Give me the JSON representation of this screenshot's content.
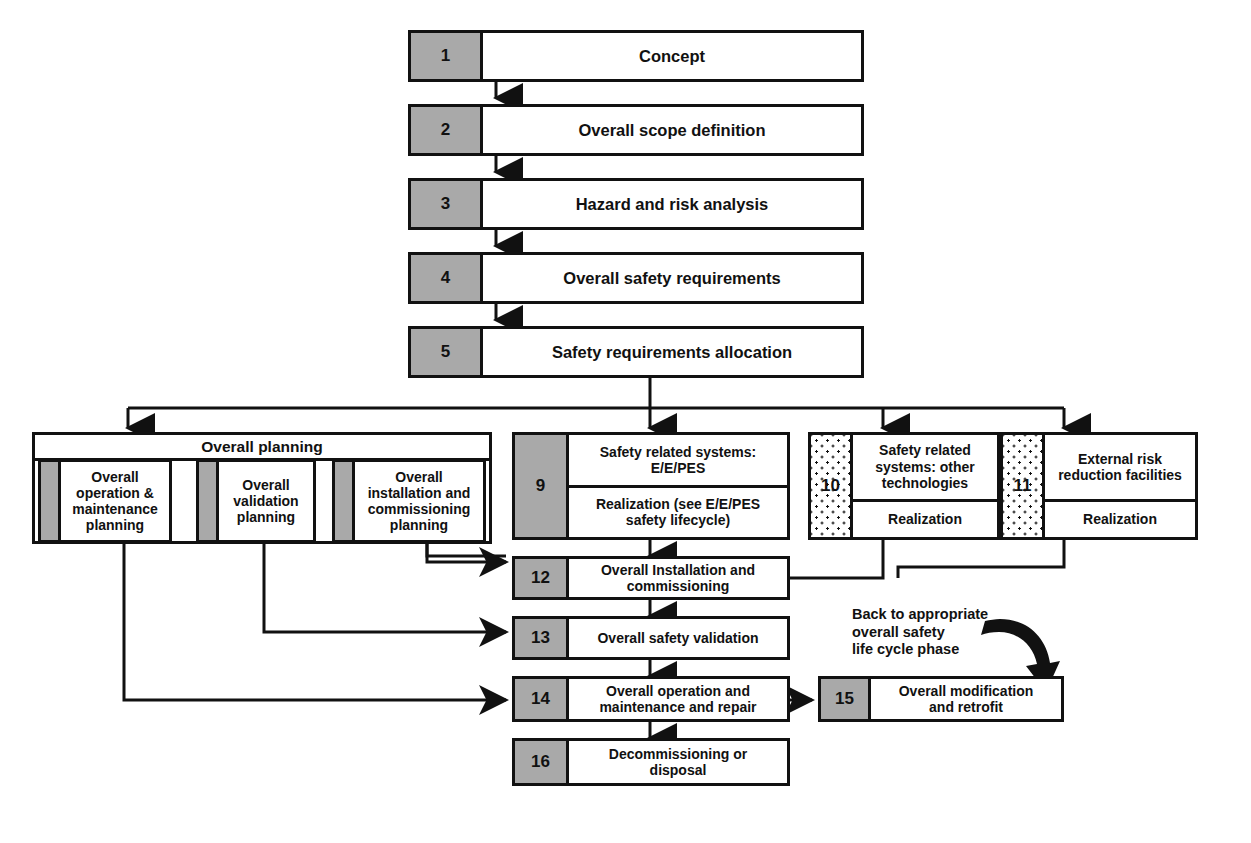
{
  "diagram": {
    "colors": {
      "line": "#111111",
      "number_fill": "#a9a9a9",
      "background": "#ffffff"
    },
    "group": {
      "label": "Overall planning"
    },
    "annotation": {
      "back_to_phase": "Back to appropriate\noverall safety\nlife cycle phase"
    },
    "nodes": [
      {
        "id": "n1",
        "number": "1",
        "label": "Concept"
      },
      {
        "id": "n2",
        "number": "2",
        "label": "Overall scope definition"
      },
      {
        "id": "n3",
        "number": "3",
        "label": "Hazard and risk analysis"
      },
      {
        "id": "n4",
        "number": "4",
        "label": "Overall safety requirements"
      },
      {
        "id": "n5",
        "number": "5",
        "label": "Safety requirements allocation"
      },
      {
        "id": "n6",
        "number": "",
        "label": "Overall\noperation &\nmaintenance\nplanning"
      },
      {
        "id": "n7",
        "number": "",
        "label": "Overall\nvalidation\nplanning"
      },
      {
        "id": "n8",
        "number": "",
        "label": "Overall\ninstallation and\ncommissioning\nplanning"
      },
      {
        "id": "n9",
        "number": "9",
        "label": "Safety related systems:\nE/E/PES",
        "label2": "Realization (see E/E/PES\nsafety lifecycle)"
      },
      {
        "id": "n10",
        "number": "10",
        "label": "Safety related\nsystems: other\ntechnologies",
        "label2": "Realization"
      },
      {
        "id": "n11",
        "number": "11",
        "label": "External risk\nreduction facilities",
        "label2": "Realization"
      },
      {
        "id": "n12",
        "number": "12",
        "label": "Overall Installation and\ncommissioning"
      },
      {
        "id": "n13",
        "number": "13",
        "label": "Overall safety validation"
      },
      {
        "id": "n14",
        "number": "14",
        "label": "Overall operation and\nmaintenance and repair"
      },
      {
        "id": "n15",
        "number": "15",
        "label": "Overall modification\nand retrofit"
      },
      {
        "id": "n16",
        "number": "16",
        "label": "Decommissioning or\ndisposal"
      }
    ]
  }
}
